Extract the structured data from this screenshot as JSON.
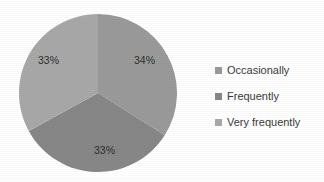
{
  "chart_data": {
    "type": "pie",
    "title": "",
    "labels": [
      "Occasionally",
      "Frequently",
      "Very frequently"
    ],
    "values": [
      34,
      33,
      33
    ],
    "value_labels": [
      "34%",
      "33%",
      "33%"
    ],
    "colors": [
      "#9a9a9a",
      "#878787",
      "#a8a8a8"
    ],
    "legend_position": "right",
    "grid": false,
    "start_angle_deg": 0,
    "direction": "clockwise",
    "slices": [
      {
        "label": "Occasionally",
        "value": 34,
        "display": "34%",
        "color": "#9a9a9a",
        "position": "right"
      },
      {
        "label": "Frequently",
        "value": 33,
        "display": "33%",
        "color": "#878787",
        "position": "bottom"
      },
      {
        "label": "Very frequently",
        "value": 33,
        "display": "33%",
        "color": "#a8a8a8",
        "position": "left"
      }
    ]
  },
  "legend": {
    "items": [
      {
        "label": "Occasionally",
        "color": "#9a9a9a"
      },
      {
        "label": "Frequently",
        "color": "#878787"
      },
      {
        "label": "Very frequently",
        "color": "#a8a8a8"
      }
    ]
  },
  "background_color": "#ffffff",
  "label_text_color": "#2f2f2f"
}
